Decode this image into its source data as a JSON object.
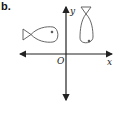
{
  "figure": {
    "label": "b.",
    "axes": {
      "x_label": "x",
      "y_label": "y",
      "origin_label": "O"
    },
    "shapes": [
      {
        "name": "fish-horizontal",
        "orientation": "tail-left",
        "quadrant": "II"
      },
      {
        "name": "fish-vertical",
        "orientation": "tail-up",
        "quadrant": "I"
      }
    ],
    "colors": {
      "stroke": "#444444",
      "background": "#ffffff"
    }
  }
}
